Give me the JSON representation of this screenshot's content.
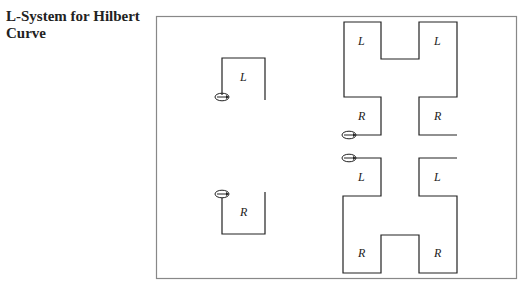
{
  "title": "L-System for Hilbert Curve",
  "title_lines": [
    "L-System for Hilbert",
    "Curve"
  ],
  "colors": {
    "line": "#222222",
    "frame": "#888888"
  },
  "labels": {
    "single_L": "L",
    "single_R": "R",
    "top_left": "L",
    "top_right": "L",
    "upper_mid_left": "R",
    "upper_mid_right": "R",
    "lower_mid_left": "L",
    "lower_mid_right": "L",
    "bottom_left": "R",
    "bottom_right": "R"
  }
}
